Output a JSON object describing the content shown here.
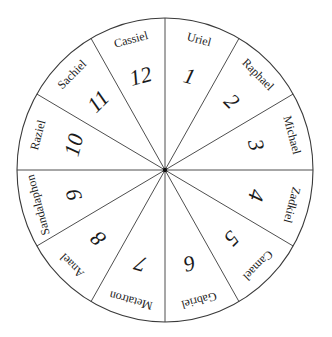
{
  "diagram": {
    "type": "wheel",
    "segment_count": 12,
    "colors": {
      "line": "#3a3a3a",
      "text": "#222222",
      "background": "#ffffff",
      "hub": "#111111"
    },
    "segments": [
      {
        "number": "1",
        "name": "Uriel"
      },
      {
        "number": "2",
        "name": "Raphael"
      },
      {
        "number": "3",
        "name": "Michael"
      },
      {
        "number": "4",
        "name": "Zadkiel"
      },
      {
        "number": "5",
        "name": "Camael"
      },
      {
        "number": "6",
        "name": "Gabriel"
      },
      {
        "number": "7",
        "name": "Metatron"
      },
      {
        "number": "8",
        "name": "Anael"
      },
      {
        "number": "9",
        "name": "Sandalaphon"
      },
      {
        "number": "10",
        "name": "Raziel"
      },
      {
        "number": "11",
        "name": "Sachiel"
      },
      {
        "number": "12",
        "name": "Cassiel"
      }
    ]
  }
}
